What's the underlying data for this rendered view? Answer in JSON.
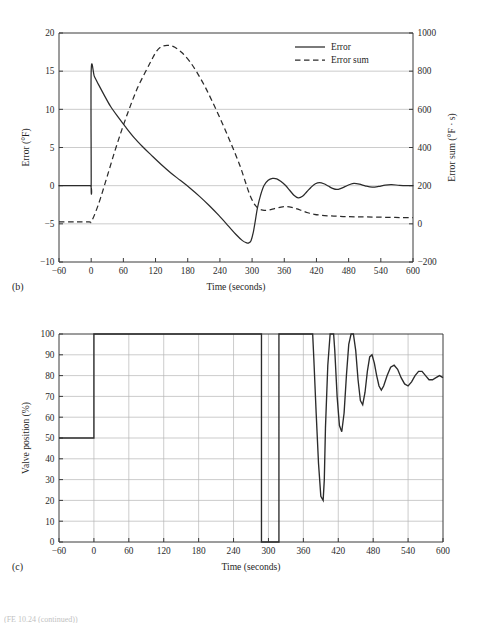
{
  "figure": {
    "background": "#ffffff",
    "line_color": "#2b2b2b",
    "grid_color": "#b6b6b6",
    "axis_color": "#3a3a3a",
    "footer_text": "(FE 10.24 (continued))"
  },
  "panel_b": {
    "tag": "(b)"
  },
  "panel_c": {
    "tag": "(c)"
  },
  "chart_data": [
    {
      "id": "panel-b",
      "type": "line",
      "title": "",
      "panel_label": "(b)",
      "xlabel": "Time (seconds)",
      "ylabel": "Error (°F)",
      "y2label": "Error sum (°F · s)",
      "xlim": [
        -60,
        600
      ],
      "ylim": [
        -10,
        20
      ],
      "y2lim": [
        -200,
        1000
      ],
      "xticks": [
        -60,
        0,
        60,
        120,
        180,
        240,
        300,
        360,
        420,
        480,
        540,
        600
      ],
      "xticklabels": [
        "−60",
        "0",
        "60",
        "120",
        "180",
        "240",
        "300",
        "360",
        "420",
        "480",
        "540",
        "600"
      ],
      "yticks": [
        -10,
        -5,
        0,
        5,
        10,
        15,
        20
      ],
      "yticklabels": [
        "−10",
        "−5",
        "0",
        "5",
        "10",
        "15",
        "20"
      ],
      "y2ticks": [
        -200,
        0,
        200,
        400,
        600,
        800,
        1000
      ],
      "y2ticklabels": [
        "−200",
        "0",
        "200",
        "400",
        "600",
        "800",
        "1000"
      ],
      "grid": true,
      "grid_axis": "y",
      "legend": [
        "Error",
        "Error sum"
      ],
      "legend_position": "top-right",
      "series": [
        {
          "name": "Error",
          "axis": "left",
          "style": "solid",
          "units": "°F",
          "x": [
            -60,
            -30,
            -2,
            0,
            0,
            6,
            14,
            24,
            36,
            50,
            64,
            80,
            96,
            112,
            130,
            148,
            166,
            184,
            202,
            220,
            238,
            256,
            270,
            282,
            290,
            294,
            298,
            302,
            306,
            310,
            316,
            322,
            330,
            338,
            346,
            354,
            362,
            370,
            378,
            386,
            394,
            402,
            410,
            418,
            426,
            434,
            442,
            450,
            458,
            466,
            474,
            482,
            490,
            500,
            512,
            524,
            536,
            548,
            560,
            575,
            590,
            600
          ],
          "y": [
            0,
            0,
            0,
            0,
            15,
            14.3,
            13.2,
            11.9,
            10.4,
            9.0,
            7.7,
            6.3,
            5.1,
            4.0,
            2.8,
            1.7,
            0.7,
            -0.3,
            -1.4,
            -2.6,
            -3.9,
            -5.3,
            -6.4,
            -7.2,
            -7.5,
            -7.5,
            -7.2,
            -6.2,
            -4.6,
            -2.9,
            -1.2,
            0.0,
            0.7,
            0.95,
            0.9,
            0.55,
            0.05,
            -0.6,
            -1.25,
            -1.6,
            -1.4,
            -0.8,
            -0.2,
            0.25,
            0.4,
            0.25,
            -0.05,
            -0.35,
            -0.5,
            -0.35,
            -0.1,
            0.15,
            0.3,
            0.2,
            -0.05,
            -0.2,
            -0.1,
            0.08,
            0.14,
            0.04,
            0.0,
            0.0
          ]
        },
        {
          "name": "Error sum",
          "axis": "right",
          "style": "dashed",
          "units": "°F · s",
          "x": [
            -60,
            -30,
            -4,
            0,
            8,
            18,
            30,
            44,
            58,
            72,
            86,
            100,
            112,
            122,
            132,
            144,
            156,
            170,
            184,
            198,
            212,
            226,
            240,
            254,
            266,
            278,
            288,
            296,
            304,
            312,
            320,
            330,
            342,
            354,
            364,
            374,
            384,
            394,
            404,
            416,
            428,
            442,
            458,
            474,
            492,
            512,
            534,
            556,
            578,
            600
          ],
          "y_right": [
            10,
            10,
            10,
            10,
            60,
            140,
            250,
            380,
            500,
            610,
            710,
            790,
            855,
            905,
            930,
            935,
            925,
            895,
            850,
            790,
            720,
            640,
            555,
            465,
            385,
            300,
            215,
            150,
            105,
            80,
            72,
            72,
            80,
            88,
            90,
            86,
            78,
            68,
            58,
            50,
            45,
            42,
            40,
            38,
            37,
            36,
            35,
            34,
            33,
            32
          ]
        }
      ],
      "annotations": {
        "error_step_time": 0,
        "error_step_value": 15,
        "error_min_value": -7.5,
        "error_min_time": 292,
        "error_sum_peak_value": 935,
        "error_sum_peak_time": 144,
        "error_sum_initial_value": 10,
        "error_settled_value": 0,
        "error_sum_settled_value": 32
      }
    },
    {
      "id": "panel-c",
      "type": "line",
      "title": "",
      "panel_label": "(c)",
      "xlabel": "Time (seconds)",
      "ylabel": "Valve position (%)",
      "xlim": [
        -60,
        600
      ],
      "ylim": [
        0,
        100
      ],
      "xticks": [
        -60,
        0,
        60,
        120,
        180,
        240,
        300,
        360,
        420,
        480,
        540,
        600
      ],
      "xticklabels": [
        "−60",
        "0",
        "60",
        "120",
        "180",
        "240",
        "300",
        "360",
        "420",
        "480",
        "540",
        "600"
      ],
      "yticks": [
        0,
        10,
        20,
        30,
        40,
        50,
        60,
        70,
        80,
        90,
        100
      ],
      "yticklabels": [
        "0",
        "10",
        "20",
        "30",
        "40",
        "50",
        "60",
        "70",
        "80",
        "90",
        "100"
      ],
      "grid": true,
      "grid_axis": "both",
      "legend": [],
      "series": [
        {
          "name": "Valve position",
          "axis": "left",
          "style": "solid",
          "units": "%",
          "x": [
            -60,
            -30,
            0,
            0,
            40,
            100,
            160,
            220,
            270,
            286,
            288,
            288,
            300,
            312,
            318,
            318,
            322,
            340,
            360,
            374,
            376,
            378,
            382,
            386,
            390,
            394,
            396,
            398,
            402,
            406,
            408,
            410,
            412,
            414,
            418,
            422,
            426,
            430,
            434,
            438,
            442,
            446,
            450,
            454,
            458,
            462,
            466,
            470,
            474,
            478,
            482,
            486,
            490,
            494,
            498,
            504,
            510,
            516,
            522,
            528,
            534,
            540,
            546,
            552,
            558,
            564,
            570,
            576,
            582,
            588,
            594,
            600
          ],
          "y": [
            50,
            50,
            50,
            100,
            100,
            100,
            100,
            100,
            100,
            100,
            100,
            0,
            0,
            0,
            0,
            100,
            100,
            100,
            100,
            100,
            100,
            88,
            62,
            38,
            22,
            20,
            30,
            55,
            85,
            100,
            100,
            100,
            100,
            92,
            70,
            56,
            53,
            62,
            80,
            95,
            100,
            100,
            92,
            78,
            68,
            66,
            72,
            82,
            89,
            90,
            86,
            80,
            75,
            73,
            75,
            80,
            84,
            85,
            83,
            79,
            76,
            75,
            77,
            80,
            82,
            82,
            80,
            78,
            78,
            79,
            80,
            79
          ]
        }
      ],
      "annotations": {
        "initial_value": 50,
        "step_time": 0,
        "saturate_high": 100,
        "saturate_low": 0,
        "low_window_start": 288,
        "low_window_end": 318,
        "deep_dip_min": 20,
        "deep_dip_time": 394,
        "settled_value": 79
      }
    }
  ]
}
